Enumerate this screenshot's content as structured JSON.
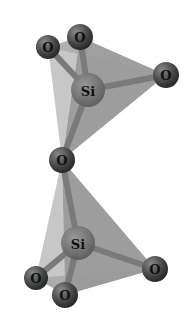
{
  "diagram": {
    "labels": {
      "o_top_left": "O",
      "o_top_mid": "O",
      "o_top_right": "O",
      "si_top": "Si",
      "o_bridge": "O",
      "si_bottom": "Si",
      "o_bottom_left": "O",
      "o_bottom_mid": "O",
      "o_bottom_right": "O"
    },
    "colors": {
      "face_light": "#b5b5b5",
      "face_mid": "#8a8a8a",
      "face_dark": "#6e6e6e",
      "atom": "#4a4a4a",
      "bond": "#7a7a7a"
    }
  }
}
